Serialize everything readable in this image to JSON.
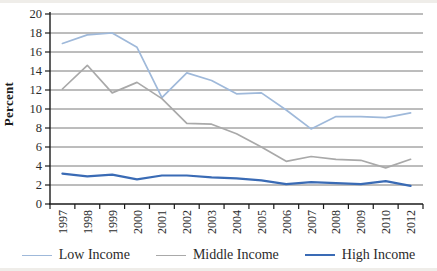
{
  "figure": {
    "y_axis_title": "Percent",
    "colors": {
      "low_income": "#9fb9da",
      "middle_income": "#a9a9a9",
      "high_income": "#3a6bb5",
      "gridline": "#7a7a7a",
      "axis": "#1a1a1a",
      "text": "#2b2b2b"
    }
  },
  "chart_data": {
    "type": "line",
    "title": "",
    "xlabel": "",
    "ylabel": "Percent",
    "ylim": [
      0,
      20
    ],
    "ytick_step": 2,
    "grid": true,
    "legend_position": "bottom",
    "categories": [
      "1997",
      "1998",
      "1999",
      "2000",
      "2001",
      "2002",
      "2003",
      "2004",
      "2005",
      "2006",
      "2007",
      "2008",
      "2009",
      "2010",
      "2012"
    ],
    "series": [
      {
        "name": "Low Income",
        "color": "#9fb9da",
        "values": [
          16.9,
          17.8,
          18.0,
          16.5,
          11.2,
          13.8,
          13.0,
          11.6,
          11.7,
          9.9,
          7.9,
          9.2,
          9.2,
          9.1,
          9.6
        ]
      },
      {
        "name": "Middle Income",
        "color": "#a9a9a9",
        "values": [
          12.1,
          14.6,
          11.7,
          12.8,
          11.1,
          8.5,
          8.4,
          7.4,
          6.0,
          4.5,
          5.0,
          4.7,
          4.6,
          3.8,
          4.7
        ]
      },
      {
        "name": "High Income",
        "color": "#3a6bb5",
        "values": [
          3.2,
          2.9,
          3.1,
          2.6,
          3.0,
          3.0,
          2.8,
          2.7,
          2.5,
          2.1,
          2.3,
          2.2,
          2.1,
          2.4,
          1.9
        ]
      }
    ]
  }
}
